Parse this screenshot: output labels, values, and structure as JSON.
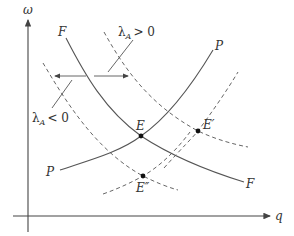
{
  "diagram": {
    "axes": {
      "y_label": "ω",
      "x_label": "q"
    },
    "curves": {
      "F_label_top": "F",
      "F_label_bottom": "F",
      "P_label_top": "P",
      "P_label_bottom": "P"
    },
    "points": {
      "E": "E",
      "E_prime": "E′",
      "E_double_prime": "E″"
    },
    "annotations": {
      "lambda_pos_symbol": "λ",
      "lambda_pos_sub": "A",
      "lambda_pos_rel": "> 0",
      "lambda_neg_symbol": "λ",
      "lambda_neg_sub": "A",
      "lambda_neg_rel": "< 0"
    },
    "colors": {
      "line": "#555555",
      "background": "#ffffff"
    }
  }
}
